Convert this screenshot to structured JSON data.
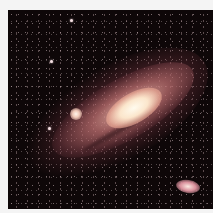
{
  "image": {
    "subject": "Andromeda galaxy",
    "description": "Spiral galaxy with bright core and two satellite galaxies against a starfield",
    "colors": {
      "background": "#0e0708",
      "core": "#fffbee",
      "disk": "#c87878",
      "border": "#f4f4f4"
    }
  }
}
